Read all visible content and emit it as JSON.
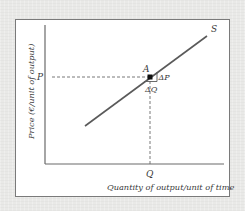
{
  "diagram": {
    "type": "supply-curve",
    "curve_label": "S",
    "point_label": "A",
    "price_label": "P",
    "quantity_label": "Q",
    "delta_p_label": "ΔP",
    "delta_q_label": "ΔQ",
    "y_axis_label": "Price (€/unit of output)",
    "x_axis_label": "Quantity of output/unit of time",
    "colors": {
      "background": "#e9e9e7",
      "panel": "#ffffff",
      "line": "#5a5a5a",
      "point": "#111111",
      "text": "#3a3a3a"
    }
  }
}
